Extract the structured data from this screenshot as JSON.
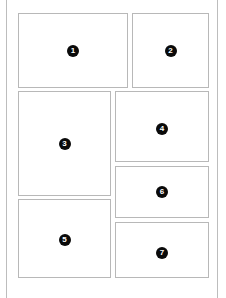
{
  "diagram": {
    "type": "page-layout-wireframe",
    "panels": [
      {
        "id": "p1",
        "label": "1"
      },
      {
        "id": "p2",
        "label": "2"
      },
      {
        "id": "p3",
        "label": "3"
      },
      {
        "id": "p4",
        "label": "4"
      },
      {
        "id": "p5",
        "label": "5"
      },
      {
        "id": "p6",
        "label": "6"
      },
      {
        "id": "p7",
        "label": "7"
      }
    ],
    "colors": {
      "panel_border": "#b8b8b8",
      "frame_border": "#bdbdbd",
      "badge_fill": "#0a0a0a",
      "badge_text": "#ffffff"
    }
  }
}
